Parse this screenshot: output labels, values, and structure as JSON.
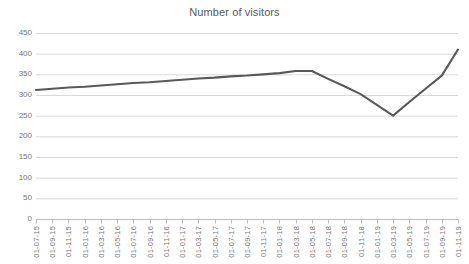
{
  "chart_data": {
    "type": "line",
    "title": "Number of visitors",
    "xlabel": "",
    "ylabel": "",
    "ylim": [
      0,
      450
    ],
    "yticks": [
      0,
      50,
      100,
      150,
      200,
      250,
      300,
      350,
      400,
      450
    ],
    "grid": true,
    "legend": false,
    "legend_position": "none",
    "line_color": "#595959",
    "gridline_color": "#d9d9d9",
    "tick_label_color": "#777777",
    "categories": [
      "01-07-15",
      "01-09-15",
      "01-11-15",
      "01-01-16",
      "01-03-16",
      "01-05-16",
      "01-07-16",
      "01-09-16",
      "01-11-16",
      "01-01-17",
      "01-03-17",
      "01-05-17",
      "01-07-17",
      "01-09-17",
      "01-11-17",
      "01-01-18",
      "01-03-18",
      "01-05-18",
      "01-07-18",
      "01-09-18",
      "01-11-18",
      "01-01-19",
      "01-03-19",
      "01-05-19",
      "01-07-19",
      "01-09-19",
      "01-11-19"
    ],
    "values": [
      312,
      315,
      318,
      320,
      323,
      326,
      329,
      331,
      334,
      337,
      340,
      342,
      345,
      347,
      350,
      353,
      358,
      358,
      339,
      321,
      302,
      276,
      250,
      283,
      315,
      347,
      410
    ],
    "series": [
      {
        "name": "Number of visitors",
        "values": [
          312,
          315,
          318,
          320,
          323,
          326,
          329,
          331,
          334,
          337,
          340,
          342,
          345,
          347,
          350,
          353,
          358,
          358,
          339,
          321,
          302,
          276,
          250,
          283,
          315,
          347,
          410
        ]
      }
    ],
    "annotations": {
      "start_value": 312,
      "peak_value": 358,
      "peak_category": "01-03-18",
      "trough_value": 250,
      "trough_category": "01-03-19",
      "end_value": 410,
      "end_category": "01-11-19"
    }
  }
}
